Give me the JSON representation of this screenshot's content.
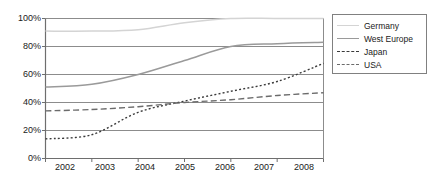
{
  "chart_data": {
    "type": "line",
    "title": "",
    "xlabel": "",
    "ylabel": "",
    "x": [
      "2002",
      "2003",
      "2004",
      "2005",
      "2006",
      "2007",
      "2008"
    ],
    "ylim": [
      0,
      100
    ],
    "xlim": [
      2002,
      2008
    ],
    "y_ticks": [
      "0%",
      "20%",
      "40%",
      "60%",
      "80%",
      "100%"
    ],
    "y_tick_values": [
      0,
      20,
      40,
      60,
      80,
      100
    ],
    "grid": true,
    "legend_position": "right",
    "series": [
      {
        "name": "Germany",
        "values": [
          91,
          91,
          92,
          97,
          100,
          100,
          100
        ],
        "style": "solid",
        "color": "#d4d4d4"
      },
      {
        "name": "West Europe",
        "values": [
          51,
          53,
          60,
          70,
          80,
          82,
          83
        ],
        "style": "solid",
        "color": "#9a9a9a"
      },
      {
        "name": "Japan",
        "values": [
          14,
          17,
          33,
          41,
          48,
          55,
          68
        ],
        "style": "dotted",
        "color": "#3a3a3a"
      },
      {
        "name": "USA",
        "values": [
          34,
          35,
          37,
          40,
          42,
          45,
          47
        ],
        "style": "dashed",
        "color": "#6b6b6b"
      }
    ]
  },
  "axis": {
    "y_labels": [
      "100%",
      "80%",
      "60%",
      "40%",
      "20%",
      "0%"
    ],
    "x_labels": [
      "2002",
      "2003",
      "2004",
      "2005",
      "2006",
      "2007",
      "2008"
    ]
  },
  "legend": {
    "entries": [
      {
        "label": "Germany"
      },
      {
        "label": "West Europe"
      },
      {
        "label": "Japan"
      },
      {
        "label": "USA"
      }
    ]
  },
  "colors": {
    "axis": "#6e6e6e",
    "grid": "#8c8c8c",
    "frame": "#808080",
    "text": "#1a1a1a",
    "background": "#ffffff"
  }
}
